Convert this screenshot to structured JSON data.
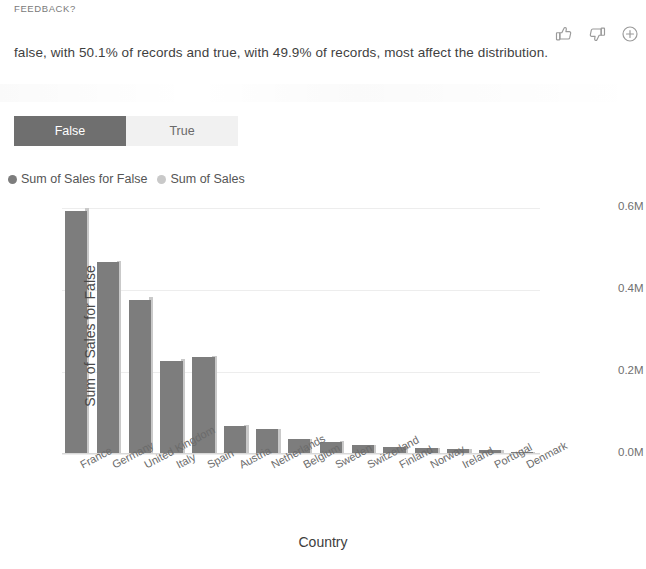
{
  "feedback": {
    "label": "FEEDBACK?",
    "thumbs_up_icon": "thumbs-up-icon",
    "thumbs_down_icon": "thumbs-down-icon",
    "add_icon": "plus-circle-icon"
  },
  "insight": {
    "text": "false, with 50.1% of records and true, with 49.9% of records, most affect the distribution."
  },
  "tabs": [
    {
      "label": "False",
      "selected": true
    },
    {
      "label": "True",
      "selected": false
    }
  ],
  "legend": [
    {
      "label": "Sum of Sales for False",
      "color": "#7d7d7d"
    },
    {
      "label": "Sum of Sales",
      "color": "#c9c9c9"
    }
  ],
  "colors": {
    "series_false": "#7d7d7d",
    "series_total": "#c9c9c9",
    "tab_selected_bg": "#6f6f6f",
    "tab_unselected_bg": "#f1f1f1",
    "grid": "#ededed",
    "text": "#3b3b3b"
  },
  "chart_data": {
    "type": "bar",
    "title": "",
    "xlabel": "Country",
    "ylabel": "Sum of Sales for False",
    "y2label": "Sum of Sales",
    "ylim": [
      0,
      0.3
    ],
    "y2lim": [
      0,
      0.6
    ],
    "yticks": [
      "0.0M",
      "0.1M",
      "0.2M",
      "0.3M"
    ],
    "ytick_values": [
      0.0,
      0.1,
      0.2,
      0.3
    ],
    "y2ticks": [
      "0.0M",
      "0.2M",
      "0.4M",
      "0.6M"
    ],
    "y2tick_values": [
      0.0,
      0.2,
      0.4,
      0.6
    ],
    "grid": true,
    "legend_position": "top-left",
    "categories": [
      "France",
      "Germany",
      "United Kingdom",
      "Italy",
      "Spain",
      "Austria",
      "Netherlands",
      "Belgium",
      "Sweden",
      "Switzerland",
      "Finland",
      "Norway",
      "Ireland",
      "Portugal",
      "Denmark"
    ],
    "series": [
      {
        "name": "Sum of Sales for False",
        "axis": "left",
        "color": "#7d7d7d",
        "values": [
          0.296,
          0.234,
          0.188,
          0.113,
          0.118,
          0.034,
          0.03,
          0.018,
          0.015,
          0.011,
          0.009,
          0.007,
          0.006,
          0.005,
          0.002
        ]
      },
      {
        "name": "Sum of Sales",
        "axis": "right",
        "color": "#c9c9c9",
        "values": [
          0.6,
          0.47,
          0.382,
          0.232,
          0.24,
          0.07,
          0.062,
          0.037,
          0.031,
          0.023,
          0.019,
          0.015,
          0.013,
          0.011,
          0.005
        ]
      }
    ]
  }
}
